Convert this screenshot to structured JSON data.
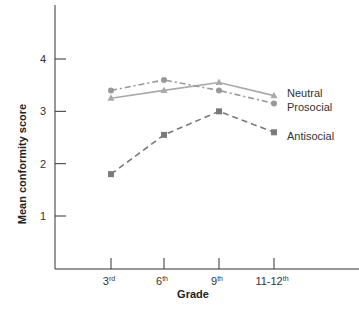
{
  "chart_data": {
    "type": "line",
    "title": "",
    "xlabel": "Grade",
    "ylabel": "Mean conformity score",
    "categories": [
      "3rd",
      "6th",
      "9th",
      "11-12th"
    ],
    "category_labels": [
      {
        "base": "3",
        "sup": "rd"
      },
      {
        "base": "6",
        "sup": "th"
      },
      {
        "base": "9",
        "sup": "th"
      },
      {
        "base": "11-12",
        "sup": "th"
      }
    ],
    "yticks": [
      1,
      2,
      3,
      4
    ],
    "ylim": [
      0,
      4.8
    ],
    "grid": false,
    "legend_position": "right, inline labels",
    "series": [
      {
        "name": "Neutral",
        "marker": "triangle",
        "line": "solid",
        "color": "#aaaaaa",
        "values": [
          3.25,
          3.4,
          3.55,
          3.3
        ]
      },
      {
        "name": "Prosocial",
        "marker": "circle",
        "line": "dash-dot",
        "color": "#999999",
        "values": [
          3.4,
          3.6,
          3.4,
          3.15
        ]
      },
      {
        "name": "Antisocial",
        "marker": "square",
        "line": "dashed",
        "color": "#7a7a7a",
        "values": [
          1.8,
          2.55,
          3.0,
          2.6
        ]
      }
    ]
  }
}
